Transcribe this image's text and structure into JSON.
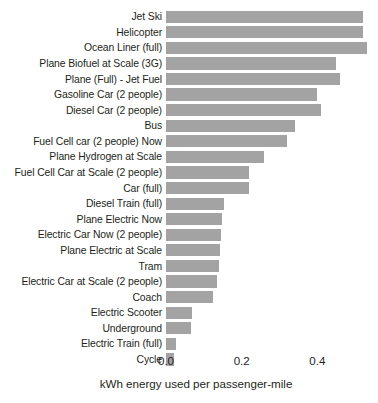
{
  "chart_data": {
    "type": "bar",
    "orientation": "horizontal",
    "title": "",
    "xlabel": "kWh energy used per passenger-mile",
    "ylabel": "",
    "xlim": [
      0,
      0.56
    ],
    "xticks": [
      0.0,
      0.2,
      0.4
    ],
    "xtick_labels": [
      "0.0",
      "0.2",
      "0.4"
    ],
    "grid": false,
    "legend": "none",
    "bar_color": "#a3a3a3",
    "background_color": "#ffffff",
    "text_color": "#231f20",
    "categories": [
      "Jet Ski",
      "Helicopter",
      "Ocean Liner (full)",
      "Plane Biofuel at Scale (3G)",
      "Plane (Full) - Jet Fuel",
      "Gasoline Car (2 people)",
      "Diesel Car (2 people)",
      "Bus",
      "Fuel Cell car (2 people) Now",
      "Plane Hydrogen at Scale",
      "Fuel Cell Car at Scale (2 people)",
      "Car (full)",
      "Diesel Train (full)",
      "Plane Electric Now",
      "Electric Car Now (2 people)",
      "Plane Electric at Scale",
      "Tram",
      "Electric Car at Scale (2 people)",
      "Coach",
      "Electric Scooter",
      "Underground",
      "Electric Train (full)",
      "Cycle"
    ],
    "values": [
      0.52,
      0.52,
      0.53,
      0.45,
      0.46,
      0.4,
      0.41,
      0.34,
      0.32,
      0.26,
      0.22,
      0.22,
      0.152,
      0.148,
      0.146,
      0.143,
      0.14,
      0.134,
      0.123,
      0.069,
      0.066,
      0.026,
      0.02
    ]
  }
}
